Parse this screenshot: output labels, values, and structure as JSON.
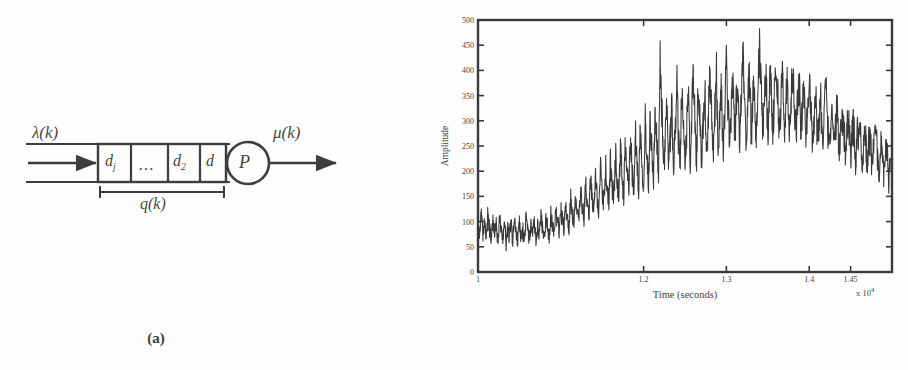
{
  "figure": {
    "panels": [
      {
        "id": "a",
        "caption": "(a)",
        "type": "block-diagram",
        "description": "Queueing system block diagram"
      },
      {
        "id": "b",
        "caption": "(b)",
        "type": "time-series-plot",
        "description": "Amplitude versus time signal"
      }
    ]
  },
  "diagram": {
    "input_label": "λ(k)",
    "output_label": "μ(k)",
    "queue_length_label": "q(k)",
    "server_label": "P",
    "queue_cells": [
      {
        "base": "d",
        "sub": "j"
      },
      {
        "base": "…",
        "sub": ""
      },
      {
        "base": "d",
        "sub": "2"
      },
      {
        "base": "d",
        "sub": ""
      }
    ],
    "colors": {
      "ink": "#141414",
      "paper": "#ffffff"
    }
  },
  "chart_data": {
    "type": "line",
    "title": "",
    "xlabel": "Time (seconds)",
    "ylabel": "Amplitude",
    "x_exponent_label": "x 10",
    "x_exponent_value": "4",
    "xlim": [
      1.0,
      1.5
    ],
    "ylim": [
      0,
      500
    ],
    "xticks": [
      1,
      1.2,
      1.3,
      1.4,
      1.45
    ],
    "xticklabels": [
      "1",
      "1.2",
      "1.3",
      "1.4",
      "1.45"
    ],
    "yticks": [
      0,
      50,
      100,
      150,
      200,
      250,
      300,
      350,
      400,
      450,
      500
    ],
    "yticklabels": [
      "0",
      "50",
      "100",
      "150",
      "200",
      "250",
      "300",
      "350",
      "400",
      "450",
      "500"
    ],
    "grid": false,
    "legend": null,
    "line_color": "#101010",
    "series": [
      {
        "name": "amplitude",
        "x": [
          1.0,
          1.002,
          1.004,
          1.006,
          1.008,
          1.01,
          1.012,
          1.014,
          1.016,
          1.018,
          1.02,
          1.022,
          1.024,
          1.026,
          1.028,
          1.03,
          1.032,
          1.034,
          1.036,
          1.038,
          1.04,
          1.042,
          1.044,
          1.046,
          1.048,
          1.05,
          1.052,
          1.054,
          1.056,
          1.058,
          1.06,
          1.062,
          1.064,
          1.066,
          1.068,
          1.07,
          1.072,
          1.074,
          1.076,
          1.078,
          1.08,
          1.082,
          1.084,
          1.086,
          1.088,
          1.09,
          1.092,
          1.094,
          1.096,
          1.098,
          1.1,
          1.102,
          1.104,
          1.106,
          1.108,
          1.11,
          1.112,
          1.114,
          1.116,
          1.118,
          1.12,
          1.122,
          1.124,
          1.126,
          1.128,
          1.13,
          1.132,
          1.134,
          1.136,
          1.138,
          1.14,
          1.142,
          1.144,
          1.146,
          1.148,
          1.15,
          1.152,
          1.154,
          1.156,
          1.158,
          1.16,
          1.162,
          1.164,
          1.166,
          1.168,
          1.17,
          1.172,
          1.174,
          1.176,
          1.178,
          1.18,
          1.182,
          1.184,
          1.186,
          1.188,
          1.19,
          1.192,
          1.194,
          1.196,
          1.198,
          1.2,
          1.202,
          1.204,
          1.206,
          1.208,
          1.21,
          1.212,
          1.214,
          1.216,
          1.218,
          1.22,
          1.222,
          1.224,
          1.226,
          1.228,
          1.23,
          1.232,
          1.234,
          1.236,
          1.238,
          1.24,
          1.242,
          1.244,
          1.246,
          1.248,
          1.25,
          1.252,
          1.254,
          1.256,
          1.258,
          1.26,
          1.262,
          1.264,
          1.266,
          1.268,
          1.27,
          1.272,
          1.274,
          1.276,
          1.278,
          1.28,
          1.282,
          1.284,
          1.286,
          1.288,
          1.29,
          1.292,
          1.294,
          1.296,
          1.298,
          1.3,
          1.302,
          1.304,
          1.306,
          1.308,
          1.31,
          1.312,
          1.314,
          1.316,
          1.318,
          1.32,
          1.322,
          1.324,
          1.326,
          1.328,
          1.33,
          1.332,
          1.334,
          1.336,
          1.338,
          1.34,
          1.342,
          1.344,
          1.346,
          1.348,
          1.35,
          1.352,
          1.354,
          1.356,
          1.358,
          1.36,
          1.362,
          1.364,
          1.366,
          1.368,
          1.37,
          1.372,
          1.374,
          1.376,
          1.378,
          1.38,
          1.382,
          1.384,
          1.386,
          1.388,
          1.39,
          1.392,
          1.394,
          1.396,
          1.398,
          1.4,
          1.402,
          1.404,
          1.406,
          1.408,
          1.41,
          1.412,
          1.414,
          1.416,
          1.418,
          1.42,
          1.422,
          1.424,
          1.426,
          1.428,
          1.43,
          1.432,
          1.434,
          1.436,
          1.438,
          1.44,
          1.442,
          1.444,
          1.446,
          1.448,
          1.45,
          1.452,
          1.454,
          1.456,
          1.458,
          1.46,
          1.462,
          1.464,
          1.466,
          1.468,
          1.47,
          1.472,
          1.474,
          1.476,
          1.478,
          1.48,
          1.482,
          1.484,
          1.486,
          1.488,
          1.49,
          1.492,
          1.494,
          1.496,
          1.498
        ],
        "values": [
          100,
          78,
          112,
          70,
          95,
          62,
          118,
          84,
          66,
          105,
          74,
          92,
          58,
          110,
          80,
          68,
          100,
          55,
          88,
          72,
          96,
          60,
          104,
          76,
          64,
          98,
          70,
          86,
          56,
          108,
          82,
          66,
          94,
          74,
          102,
          62,
          90,
          78,
          114,
          84,
          70,
          106,
          88,
          72,
          116,
          92,
          78,
          120,
          96,
          82,
          128,
          100,
          86,
          134,
          104,
          90,
          142,
          112,
          96,
          150,
          120,
          102,
          158,
          126,
          108,
          170,
          134,
          112,
          182,
          140,
          118,
          196,
          148,
          124,
          205,
          155,
          128,
          214,
          162,
          134,
          226,
          170,
          140,
          235,
          178,
          146,
          244,
          186,
          152,
          255,
          196,
          158,
          266,
          204,
          162,
          278,
          212,
          168,
          290,
          220,
          174,
          300,
          232,
          180,
          312,
          240,
          186,
          322,
          248,
          190,
          418,
          330,
          196,
          256,
          338,
          200,
          262,
          346,
          204,
          268,
          392,
          272,
          208,
          354,
          276,
          212,
          282,
          366,
          216,
          288,
          404,
          294,
          220,
          374,
          298,
          224,
          302,
          382,
          228,
          306,
          390,
          310,
          232,
          316,
          398,
          236,
          320,
          360,
          240,
          324,
          412,
          328,
          244,
          332,
          404,
          248,
          336,
          368,
          252,
          340,
          432,
          344,
          256,
          348,
          396,
          260,
          352,
          372,
          264,
          356,
          452,
          360,
          268,
          364,
          386,
          272,
          368,
          376,
          276,
          358,
          404,
          350,
          280,
          346,
          392,
          284,
          342,
          380,
          288,
          338,
          396,
          334,
          282,
          330,
          374,
          276,
          326,
          362,
          270,
          322,
          390,
          318,
          264,
          314,
          352,
          258,
          310,
          344,
          252,
          306,
          378,
          302,
          246,
          298,
          336,
          240,
          294,
          328,
          234,
          290,
          300,
          286,
          228,
          282,
          296,
          222,
          278,
          288,
          216,
          274,
          284,
          268,
          210,
          262,
          276,
          204,
          256,
          270,
          198,
          250,
          264,
          244,
          192,
          238,
          258,
          186,
          232,
          252,
          180,
          226
        ]
      }
    ]
  }
}
